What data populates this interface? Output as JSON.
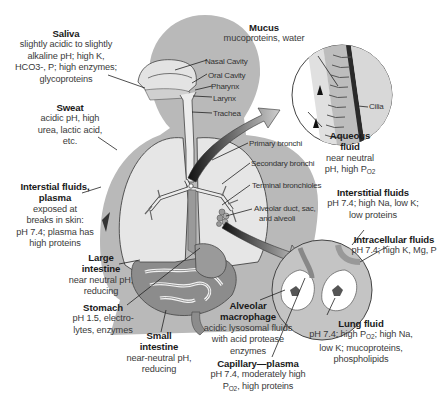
{
  "diagram": {
    "type": "anatomical-illustration"
  },
  "callouts": {
    "saliva": {
      "title": "Saliva",
      "lines": [
        "slightly acidic to slightly",
        "alkaline pH; high K,",
        "HCO3-, P; high enzymes;",
        "glycoproteins"
      ]
    },
    "sweat": {
      "title": "Sweat",
      "lines": [
        "acidic pH, high",
        "urea, lactic acid,",
        "etc."
      ]
    },
    "interstitial_skin": {
      "title_1": "Interstial fluids,",
      "title_2": "plasma",
      "lines": [
        "exposed at",
        "breaks in skin:",
        "pH 7.4; plasma has",
        "high proteins"
      ]
    },
    "large_intestine": {
      "title_1": "Large",
      "title_2": "intestine",
      "lines": [
        "near neutral pH,",
        "reducing"
      ]
    },
    "stomach": {
      "title": "Stomach",
      "lines": [
        "pH 1.5, electro-",
        "lytes, enzymes"
      ]
    },
    "small_intestine": {
      "title_1": "Small",
      "title_2": "intestine",
      "lines": [
        "near-neutral pH,",
        "reducing"
      ]
    },
    "mucus": {
      "title": "Mucus",
      "lines": [
        "mucoproteins, water"
      ]
    },
    "aqueous_fluid": {
      "title_1": "Aqueous",
      "title_2": "fluid",
      "line_1": "near neutral",
      "line_2_prefix": "pH, high P",
      "line_2_sub": "O2"
    },
    "interstitial_fluids": {
      "title": "Interstitial fluids",
      "lines": [
        "pH 7.4; high Na, low K;",
        "low proteins"
      ]
    },
    "intracellular_fluids": {
      "title": "Intracellular fluids",
      "lines": [
        "pH 7.4; high K, Mg, P"
      ]
    },
    "alveolar_macrophage": {
      "title_1": "Alveolar",
      "title_2": "macrophage",
      "lines": [
        "acidic lysosomal fluids",
        "with acid protease",
        "enzymes"
      ]
    },
    "capillary_plasma": {
      "title": "Capillary—plasma",
      "line_1": "pH 7.4, moderately high",
      "line_2_prefix": "P",
      "line_2_sub": "O2",
      "line_2_suffix": ", high proteins"
    },
    "lung_fluid": {
      "title": "Lung fluid",
      "line_1_prefix": "pH 7.4; high P",
      "line_1_sub": "O2",
      "line_1_suffix": "; high Na,",
      "line_2": "low K; mucoproteins,",
      "line_3": "phospholipids"
    }
  },
  "anatomy_labels": {
    "nasal_cavity": "Nasal Cavity",
    "oral_cavity": "Oral Cavity",
    "pharynx": "Pharynx",
    "larynx": "Larynx",
    "trachea": "Trachea",
    "primary_bronchi": "Primary bronchi",
    "secondary_bronchi": "Secondary bronchi",
    "terminal_bronchioles": "Terminal bronchioles",
    "alveolar_1": "Alveolar duct, sac,",
    "alveolar_2": "and alveoli",
    "cilia": "Cilia"
  },
  "colors": {
    "body": "#b9b9b9",
    "lung": "#e6e6e6",
    "airway": "#ececec",
    "organ_dark": "#8c8c8c",
    "outline": "#333333"
  }
}
